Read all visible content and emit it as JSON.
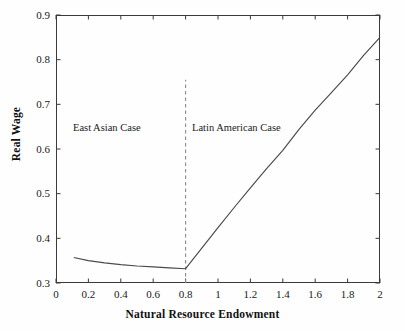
{
  "chart_data": {
    "type": "line",
    "title": "",
    "xlabel": "Natural Resource Endowment",
    "ylabel": "Real Wage",
    "xlim": [
      0,
      2
    ],
    "ylim": [
      0.3,
      0.9
    ],
    "grid": false,
    "legend": "none",
    "xticks": [
      "0",
      "0.2",
      "0.4",
      "0.6",
      "0.8",
      "1",
      "1.2",
      "1.4",
      "1.6",
      "1.8",
      "2"
    ],
    "xtick_values": [
      0,
      0.2,
      0.4,
      0.6,
      0.8,
      1.0,
      1.2,
      1.4,
      1.6,
      1.8,
      2.0
    ],
    "yticks": [
      "0.3",
      "0.4",
      "0.5",
      "0.6",
      "0.7",
      "0.8",
      "0.9"
    ],
    "ytick_values": [
      0.3,
      0.4,
      0.5,
      0.6,
      0.7,
      0.8,
      0.9
    ],
    "series": [
      {
        "name": "Real Wage",
        "color": "#4a4a4a",
        "x": [
          0.11,
          0.2,
          0.3,
          0.4,
          0.5,
          0.6,
          0.7,
          0.8,
          0.9,
          1.0,
          1.1,
          1.2,
          1.3,
          1.4,
          1.5,
          1.6,
          1.7,
          1.8,
          1.9,
          2.0
        ],
        "y": [
          0.357,
          0.35,
          0.345,
          0.341,
          0.338,
          0.336,
          0.334,
          0.332,
          0.378,
          0.424,
          0.469,
          0.513,
          0.556,
          0.597,
          0.644,
          0.687,
          0.726,
          0.766,
          0.81,
          0.85
        ]
      }
    ],
    "annotations": [
      {
        "text": "East Asian Case",
        "x": 0.52,
        "y": 0.645
      },
      {
        "text": "Latin American Case",
        "x": 1.26,
        "y": 0.645
      }
    ],
    "reference_lines": [
      {
        "orientation": "vertical",
        "x": 0.8,
        "y_start": 0.3,
        "y_end": 0.755,
        "style": "dashed",
        "color": "#8a8a8a"
      }
    ]
  },
  "axes": {
    "x_title": "Natural Resource Endowment",
    "y_title": "Real Wage"
  },
  "annotations": {
    "east_asian": "East Asian Case",
    "latin_american": "Latin American Case"
  },
  "colors": {
    "line": "#4a4a4a",
    "dashed": "#8a8a8a",
    "spine": "#3a3a3a",
    "text": "#1a1a1a",
    "background": "#fefefe"
  }
}
